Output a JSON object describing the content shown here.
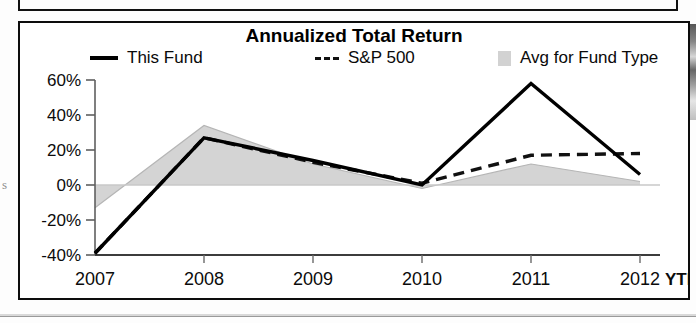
{
  "chart_data": {
    "type": "line",
    "title": "Annualized Total Return",
    "xlabel": "",
    "ylabel": "",
    "categories": [
      "2007",
      "2008",
      "2009",
      "2010",
      "2011",
      "2012"
    ],
    "x_tick_labels": [
      "2007",
      "2008",
      "2009",
      "2010",
      "2011",
      "2012"
    ],
    "x_axis_suffix": "YTD",
    "y_tick_labels": [
      "60%",
      "40%",
      "20%",
      "0%",
      "-20%",
      "-40%"
    ],
    "y_tick_values": [
      60,
      40,
      20,
      0,
      -20,
      -40
    ],
    "ylim": [
      -40,
      60
    ],
    "y_unit": "%",
    "grid": false,
    "legend_position": "top",
    "series": [
      {
        "name": "This Fund",
        "style": "solid-line",
        "color": "#000000",
        "values": [
          -39,
          27,
          14,
          0,
          58,
          6
        ]
      },
      {
        "name": "S&P 500",
        "style": "dashed-line",
        "color": "#111111",
        "values": [
          -39,
          27,
          13,
          1,
          17,
          18
        ]
      },
      {
        "name": "Avg for Fund Type",
        "style": "filled-area",
        "color": "#d2d2d2",
        "values": [
          -13,
          34,
          12,
          -2,
          12,
          2
        ]
      }
    ]
  },
  "panel": {
    "title": "Annualized Total Return"
  },
  "legend": {
    "items": [
      {
        "label": "This Fund",
        "marker": "solid-line-swatch"
      },
      {
        "label": "S&P 500",
        "marker": "dashed-line-swatch"
      },
      {
        "label": "Avg for Fund Type",
        "marker": "gray-area-swatch"
      }
    ]
  },
  "axes": {
    "y_labels": [
      "60%",
      "40%",
      "20%",
      "0%",
      "-20%",
      "-40%"
    ],
    "x_labels": [
      "2007",
      "2008",
      "2009",
      "2010",
      "2011",
      "2012"
    ],
    "x_suffix": "YTD"
  },
  "artifacts": {
    "left_margin_mark": "s"
  }
}
